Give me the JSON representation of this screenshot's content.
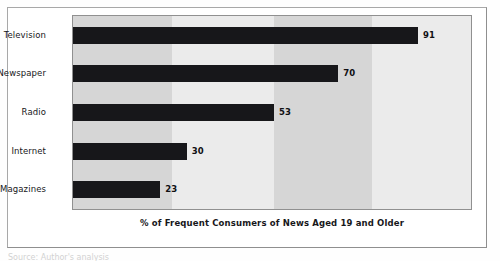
{
  "figure": {
    "scan_footer_text": "Source: Author's analysis"
  },
  "chart_data": {
    "type": "bar",
    "orientation": "horizontal",
    "title": "",
    "subtitle": "",
    "xlabel": "% of Frequent Consumers of News Aged 19 and Older",
    "ylabel": "",
    "categories": [
      "Television",
      "Newspaper",
      "Radio",
      "Internet",
      "Magazines"
    ],
    "values": [
      91,
      70,
      53,
      30,
      23
    ],
    "value_labels": [
      "91",
      "70",
      "53",
      "30",
      "23"
    ],
    "series": [
      {
        "name": "% of Frequent Consumers of News Aged 19 and Older",
        "values": [
          91,
          70,
          53,
          30,
          23
        ]
      }
    ],
    "xlim": [
      0,
      105
    ],
    "ylim": [
      0,
      5
    ],
    "grid": false,
    "legend": false,
    "legend_position": "none",
    "bar_color": "#17171a",
    "plot_background": "#e3e3e3",
    "background_bands": [
      {
        "from": 0,
        "to": 26,
        "color": "#d6d6d6"
      },
      {
        "from": 26,
        "to": 53,
        "color": "#ebebeb"
      },
      {
        "from": 53,
        "to": 79,
        "color": "#d6d6d6"
      },
      {
        "from": 79,
        "to": 105,
        "color": "#ebebeb"
      }
    ]
  }
}
